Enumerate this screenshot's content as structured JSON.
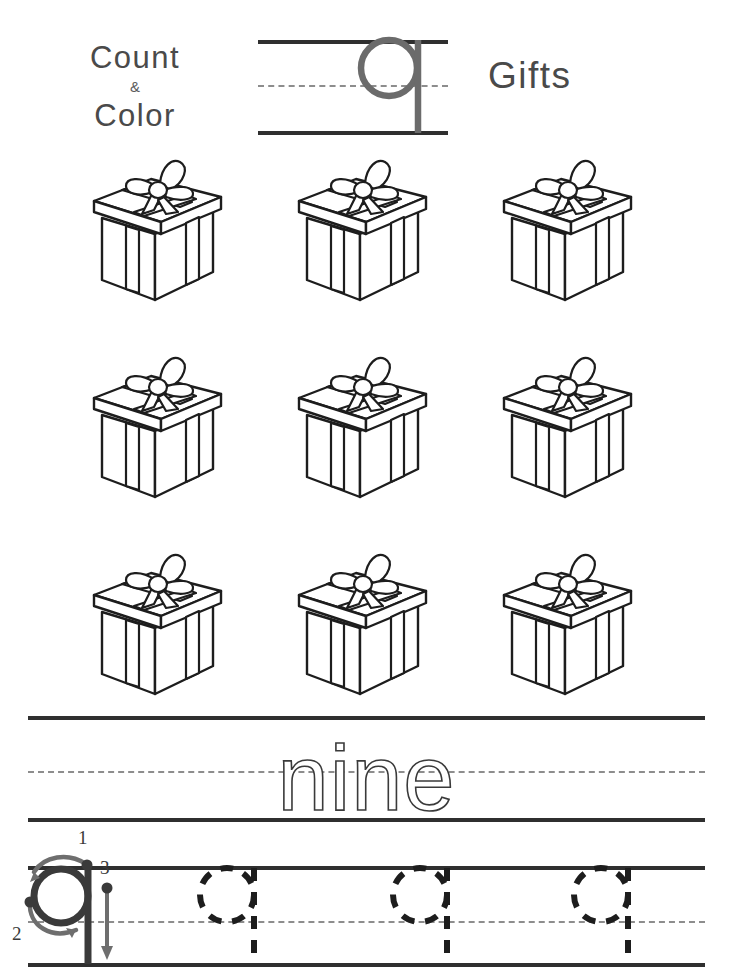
{
  "worksheet": {
    "title_line1": "Count",
    "title_amp": "&",
    "title_line2": "Color",
    "subject_noun": "Gifts",
    "focus_letter": "q",
    "number_word": "nine",
    "number_value": 9,
    "object_icon": "gift-box-icon",
    "object_count": 9,
    "grid_rows": 3,
    "grid_cols": 3
  },
  "stroke_order": {
    "markers": [
      "1",
      "2",
      "3"
    ],
    "marker_1": "1",
    "marker_2": "2",
    "marker_3": "3"
  },
  "tracing": {
    "letters": [
      "q",
      "q",
      "q"
    ],
    "count": 3
  },
  "colors": {
    "ink": "#2f2f2f",
    "text_gray": "#4a4a4a",
    "guide_dash": "#8d8d8d",
    "letter_gray": "#6b6b6b",
    "paper": "#ffffff"
  }
}
